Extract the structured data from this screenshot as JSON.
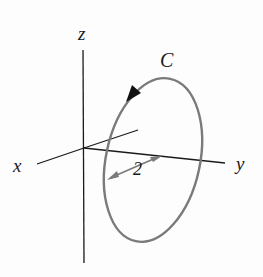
{
  "diagram": {
    "type": "3d-axes-with-closed-curve",
    "axes": {
      "x_label": "x",
      "y_label": "y",
      "z_label": "z"
    },
    "curve": {
      "label": "C",
      "shape": "circle (drawn as ellipse in perspective)",
      "orientation_arrow": "clockwise as viewed (arrow near top-left of curve pointing down-left)",
      "radius_label": "2"
    },
    "colors": {
      "axis": "#1a1a1a",
      "curve": "#7a7a7a",
      "text": "#1a1a1a"
    }
  }
}
